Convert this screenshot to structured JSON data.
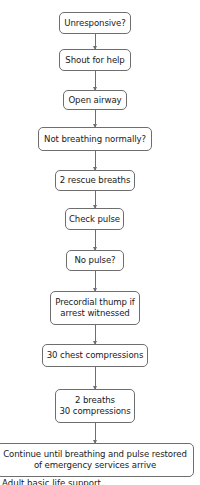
{
  "diagram": {
    "type": "flowchart",
    "direction": "top-to-bottom",
    "colors": {
      "stroke": "#6e6e6e",
      "fill": "#ffffff",
      "text": "#1a1a1a"
    },
    "nodes": [
      {
        "id": "n1",
        "lines": [
          "Unresponsive?"
        ]
      },
      {
        "id": "n2",
        "lines": [
          "Shout for help"
        ]
      },
      {
        "id": "n3",
        "lines": [
          "Open airway"
        ]
      },
      {
        "id": "n4",
        "lines": [
          "Not breathing normally?"
        ]
      },
      {
        "id": "n5",
        "lines": [
          "2 rescue breaths"
        ]
      },
      {
        "id": "n6",
        "lines": [
          "Check pulse"
        ]
      },
      {
        "id": "n7",
        "lines": [
          "No pulse?"
        ]
      },
      {
        "id": "n8",
        "lines": [
          "Precordial thump if",
          "arrest witnessed"
        ]
      },
      {
        "id": "n9",
        "lines": [
          "30 chest compressions"
        ]
      },
      {
        "id": "n10",
        "lines": [
          "2 breaths",
          "30 compressions"
        ]
      },
      {
        "id": "n11",
        "lines": [
          "Continue until breathing and pulse restored",
          "of emergency services arrive"
        ]
      }
    ],
    "edges": [
      [
        "n1",
        "n2"
      ],
      [
        "n2",
        "n3"
      ],
      [
        "n3",
        "n4"
      ],
      [
        "n4",
        "n5"
      ],
      [
        "n5",
        "n6"
      ],
      [
        "n6",
        "n7"
      ],
      [
        "n7",
        "n8"
      ],
      [
        "n8",
        "n9"
      ],
      [
        "n9",
        "n10"
      ],
      [
        "n10",
        "n11"
      ]
    ],
    "footer_cut_text": "Adult basic life support"
  }
}
